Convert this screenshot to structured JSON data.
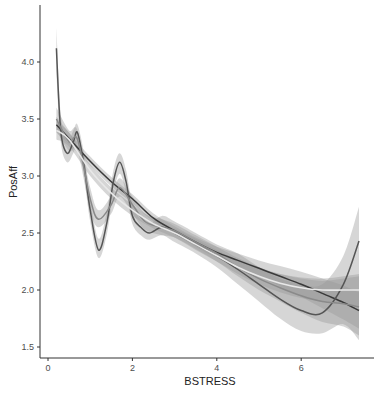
{
  "chart_data": {
    "type": "line",
    "title": "",
    "xlabel": "BSTRESS",
    "ylabel": "PosAff",
    "xlim": [
      -0.2,
      7.7
    ],
    "ylim": [
      1.42,
      4.5
    ],
    "x_ticks": [
      0,
      2,
      4,
      6
    ],
    "x_tick_labels": [
      "0",
      "2",
      "4",
      "6"
    ],
    "y_ticks": [
      1.5,
      2.0,
      2.5,
      3.0,
      3.5,
      4.0
    ],
    "y_tick_labels": [
      "1.5",
      "2.0",
      "2.5",
      "3.0",
      "3.5",
      "4.0"
    ],
    "grid": false,
    "legend": "none",
    "series": [
      {
        "name": "smooth-dark",
        "color": "#3a3a3a",
        "x": [
          0.2,
          0.5,
          1.0,
          1.5,
          2.0,
          2.5,
          3.0,
          3.5,
          4.0,
          4.5,
          5.0,
          5.5,
          6.0,
          6.5,
          7.0,
          7.37
        ],
        "y": [
          3.45,
          3.33,
          3.13,
          2.95,
          2.8,
          2.63,
          2.52,
          2.42,
          2.33,
          2.26,
          2.19,
          2.12,
          2.05,
          1.97,
          1.89,
          1.82
        ],
        "band_lower": [
          3.38,
          3.28,
          3.09,
          2.91,
          2.76,
          2.6,
          2.49,
          2.38,
          2.28,
          2.2,
          2.12,
          2.03,
          1.94,
          1.84,
          1.74,
          1.66
        ],
        "band_upper": [
          3.52,
          3.38,
          3.17,
          2.99,
          2.84,
          2.67,
          2.56,
          2.46,
          2.38,
          2.32,
          2.26,
          2.21,
          2.16,
          2.1,
          2.04,
          1.98
        ]
      },
      {
        "name": "wiggly-dark",
        "color": "#555555",
        "x": [
          0.2,
          0.3,
          0.45,
          0.6,
          0.7,
          0.85,
          1.0,
          1.2,
          1.4,
          1.55,
          1.7,
          1.85,
          2.0,
          2.2,
          2.4,
          2.7,
          3.0,
          3.5,
          4.0,
          4.5,
          5.0,
          5.5,
          6.0,
          6.5,
          7.0,
          7.37
        ],
        "y": [
          4.12,
          3.4,
          3.2,
          3.3,
          3.38,
          3.1,
          2.7,
          2.35,
          2.6,
          2.95,
          3.12,
          2.95,
          2.65,
          2.55,
          2.5,
          2.55,
          2.5,
          2.4,
          2.3,
          2.18,
          2.05,
          1.92,
          1.82,
          1.8,
          2.05,
          2.43
        ],
        "band_lower": [
          3.9,
          3.3,
          3.12,
          3.2,
          3.28,
          3.0,
          2.6,
          2.28,
          2.5,
          2.85,
          3.02,
          2.85,
          2.58,
          2.48,
          2.44,
          2.48,
          2.42,
          2.32,
          2.2,
          2.05,
          1.9,
          1.75,
          1.64,
          1.62,
          1.7,
          1.56
        ],
        "band_upper": [
          4.3,
          3.55,
          3.3,
          3.4,
          3.45,
          3.2,
          2.8,
          2.45,
          2.7,
          3.05,
          3.2,
          3.05,
          2.75,
          2.62,
          2.58,
          2.65,
          2.6,
          2.5,
          2.4,
          2.32,
          2.2,
          2.1,
          2.05,
          2.05,
          2.3,
          2.73
        ]
      },
      {
        "name": "medium-gray",
        "color": "#8a8a8a",
        "x": [
          0.2,
          0.5,
          0.7,
          1.0,
          1.2,
          1.5,
          1.7,
          2.0,
          2.3,
          2.7,
          3.0,
          3.5,
          4.0,
          4.5,
          5.0,
          5.5,
          6.0,
          6.5,
          7.0,
          7.37
        ],
        "y": [
          3.5,
          3.3,
          3.32,
          2.8,
          2.62,
          2.75,
          2.9,
          2.75,
          2.6,
          2.55,
          2.52,
          2.42,
          2.32,
          2.2,
          2.1,
          2.02,
          1.95,
          1.9,
          1.88,
          1.85
        ],
        "band_lower": [
          3.4,
          3.22,
          3.22,
          2.7,
          2.55,
          2.67,
          2.82,
          2.67,
          2.53,
          2.48,
          2.46,
          2.36,
          2.25,
          2.12,
          2.0,
          1.9,
          1.8,
          1.72,
          1.68,
          1.6
        ],
        "band_upper": [
          3.6,
          3.4,
          3.4,
          2.9,
          2.7,
          2.83,
          2.98,
          2.82,
          2.67,
          2.62,
          2.58,
          2.48,
          2.38,
          2.28,
          2.2,
          2.14,
          2.1,
          2.08,
          2.1,
          2.12
        ]
      },
      {
        "name": "light",
        "color": "#e8e8e8",
        "x": [
          0.2,
          0.5,
          1.0,
          1.5,
          2.0,
          2.5,
          3.0,
          3.5,
          4.0,
          4.5,
          5.0,
          5.5,
          6.0,
          6.5,
          7.0,
          7.37
        ],
        "y": [
          3.4,
          3.32,
          3.05,
          2.85,
          2.7,
          2.58,
          2.5,
          2.4,
          2.3,
          2.2,
          2.12,
          2.06,
          2.02,
          2.0,
          2.0,
          2.0
        ],
        "band_lower": [
          3.32,
          3.26,
          3.0,
          2.8,
          2.65,
          2.54,
          2.46,
          2.35,
          2.25,
          2.14,
          2.05,
          1.98,
          1.93,
          1.9,
          1.88,
          1.86
        ],
        "band_upper": [
          3.48,
          3.38,
          3.1,
          2.9,
          2.75,
          2.62,
          2.54,
          2.45,
          2.35,
          2.26,
          2.19,
          2.14,
          2.11,
          2.1,
          2.12,
          2.14
        ]
      }
    ]
  }
}
